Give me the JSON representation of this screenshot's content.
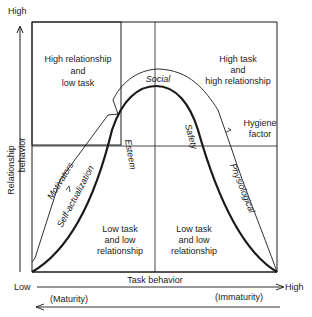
{
  "diagram": {
    "y_axis": {
      "high_label": "High",
      "title_line1": "Relationship",
      "title_line2": "behavior"
    },
    "x_axis": {
      "low_label": "Low",
      "high_label": "High",
      "title": "Task behavior",
      "left_note": "(Maturity)",
      "right_note": "(Immaturity)"
    },
    "quadrants": {
      "top_left": [
        "High relationship",
        "and",
        "low task"
      ],
      "top_right": [
        "High task",
        "and",
        "high relationship"
      ],
      "bottom_left": [
        "Low task",
        "and low",
        "relationship"
      ],
      "bottom_right": [
        "Low task",
        "and low",
        "relationship"
      ]
    },
    "curve_labels": {
      "social": "Social",
      "esteem": "Esteem",
      "safety": "Safety",
      "self_actualization": "Self-actualization",
      "physiological": "Physiological",
      "motivators": "Motivators",
      "hygiene": [
        "Hygiene",
        "factor"
      ]
    }
  }
}
